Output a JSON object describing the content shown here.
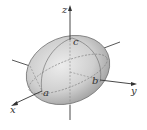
{
  "diagram": {
    "type": "ellipsoid-3d",
    "axes": [
      {
        "name": "x",
        "label": "x"
      },
      {
        "name": "y",
        "label": "y"
      },
      {
        "name": "z",
        "label": "z"
      }
    ],
    "intercepts": [
      {
        "name": "a",
        "label": "a",
        "axis": "x"
      },
      {
        "name": "b",
        "label": "b",
        "axis": "y"
      },
      {
        "name": "c",
        "label": "c",
        "axis": "z"
      }
    ],
    "colors": {
      "surface_light": "#e6e6e6",
      "surface_dark": "#9a9a9a",
      "axis": "#333333",
      "outline": "#555555"
    }
  }
}
